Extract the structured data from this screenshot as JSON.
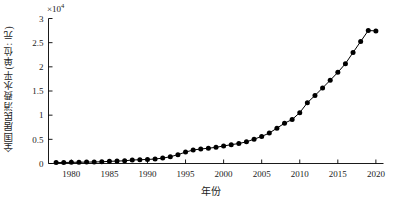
{
  "chart_data": {
    "type": "line",
    "title": "",
    "xlabel": "年份",
    "ylabel": "全国居民消费水平(单位: 元)",
    "y_exponent_label": "×10",
    "y_exponent_power": "4",
    "y_scale": 10000,
    "xlim": [
      1977,
      2021
    ],
    "ylim": [
      0,
      30000
    ],
    "xticks": [
      1980,
      1985,
      1990,
      1995,
      2000,
      2005,
      2010,
      2015,
      2020
    ],
    "xtick_labels": [
      "1980",
      "1985",
      "1990",
      "1995",
      "2000",
      "2005",
      "2010",
      "2015",
      "2020"
    ],
    "yticks": [
      0,
      5000,
      10000,
      15000,
      20000,
      25000,
      30000
    ],
    "ytick_labels": [
      "0",
      "0.5",
      "1",
      "1.5",
      "2",
      "2.5",
      "3"
    ],
    "grid": false,
    "legend": false,
    "marker": "filled-circle",
    "marker_color": "#000000",
    "line_color": "#000000",
    "x": [
      1978,
      1979,
      1980,
      1981,
      1982,
      1983,
      1984,
      1985,
      1986,
      1987,
      1988,
      1989,
      1990,
      1991,
      1992,
      1993,
      1994,
      1995,
      1996,
      1997,
      1998,
      1999,
      2000,
      2001,
      2002,
      2003,
      2004,
      2005,
      2006,
      2007,
      2008,
      2009,
      2010,
      2011,
      2012,
      2013,
      2014,
      2015,
      2016,
      2017,
      2018,
      2019,
      2020
    ],
    "values": [
      184,
      208,
      238,
      264,
      288,
      316,
      361,
      446,
      497,
      565,
      714,
      788,
      833,
      932,
      1116,
      1393,
      1833,
      2355,
      2789,
      3002,
      3159,
      3346,
      3632,
      3887,
      4144,
      4475,
      5032,
      5596,
      6299,
      7310,
      8334,
      9098,
      10522,
      12570,
      14074,
      15632,
      17221,
      18857,
      20653,
      22969,
      25245,
      27504,
      27438
    ],
    "series_name": "全国居民消费水平"
  },
  "figure": {
    "background": "#ffffff",
    "axis_color": "#000000",
    "text_color": "#1a1a1a"
  }
}
